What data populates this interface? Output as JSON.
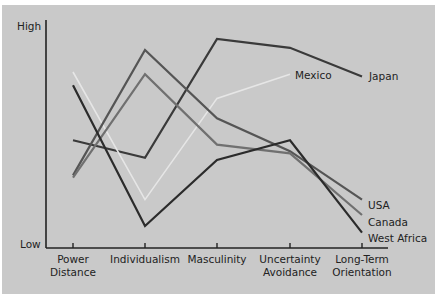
{
  "chart_data": {
    "type": "line",
    "title": "",
    "xlabel": "",
    "ylabel": "",
    "y_axis_labels": {
      "high": "High",
      "low": "Low"
    },
    "categories": [
      "Power Distance",
      "Individualism",
      "Masculinity",
      "Uncertainty Avoidance",
      "Long-Term Orientation"
    ],
    "category_lines": [
      [
        "Power",
        "Distance"
      ],
      [
        "Individualism"
      ],
      [
        "Masculinity"
      ],
      [
        "Uncertainty",
        "Avoidance"
      ],
      [
        "Long-Term",
        "Orientation"
      ]
    ],
    "ylim": [
      0,
      100
    ],
    "grid": false,
    "legend_position": "inline-end-labels",
    "series": [
      {
        "name": "Japan",
        "color": "#3a3a3a",
        "values": [
          49,
          41,
          95,
          91,
          78
        ]
      },
      {
        "name": "Mexico",
        "color": "#e6e6e6",
        "values": [
          80,
          22,
          68,
          79,
          null
        ]
      },
      {
        "name": "USA",
        "color": "#555555",
        "values": [
          33,
          90,
          59,
          44,
          22
        ]
      },
      {
        "name": "Canada",
        "color": "#707070",
        "values": [
          32,
          79,
          47,
          43,
          15
        ]
      },
      {
        "name": "West Africa",
        "color": "#2b2b2b",
        "values": [
          74,
          10,
          40,
          49,
          7
        ]
      }
    ]
  }
}
